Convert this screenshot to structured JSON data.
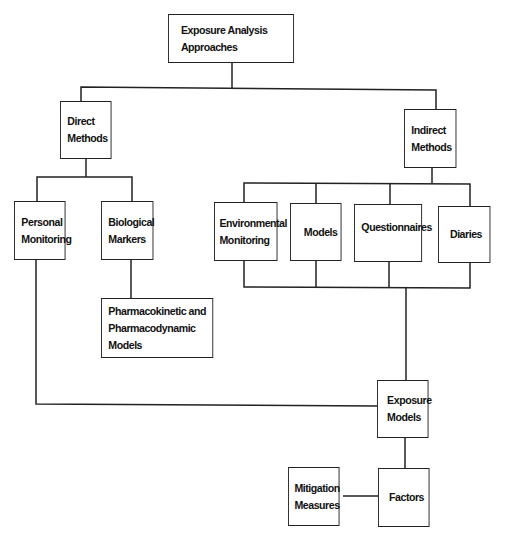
{
  "diagram": {
    "title": "Exposure Analysis Approaches",
    "nodes": {
      "root": {
        "label": "Exposure Analysis\nApproaches"
      },
      "direct": {
        "label": "Direct\nMethods"
      },
      "indirect": {
        "label": "Indirect\nMethods"
      },
      "personal": {
        "label": "Personal\nMonitoring"
      },
      "biological": {
        "label": "Biological\nMarkers"
      },
      "pharmaco": {
        "label": "Pharmacokinetic and\nPharmacodynamic Models"
      },
      "environmental": {
        "label": "Environmental\nMonitoring"
      },
      "models": {
        "label": "Models"
      },
      "questionnaires": {
        "label": "Questionnaires"
      },
      "diaries": {
        "label": "Diaries"
      },
      "exposure_models": {
        "label": "Exposure\nModels"
      },
      "factors": {
        "label": "Factors"
      },
      "mitigation": {
        "label": "Mitigation\nMeasures"
      }
    },
    "edges": [
      [
        "root",
        "direct"
      ],
      [
        "root",
        "indirect"
      ],
      [
        "direct",
        "personal"
      ],
      [
        "direct",
        "biological"
      ],
      [
        "biological",
        "pharmaco"
      ],
      [
        "indirect",
        "environmental"
      ],
      [
        "indirect",
        "models"
      ],
      [
        "indirect",
        "questionnaires"
      ],
      [
        "indirect",
        "diaries"
      ],
      [
        "environmental",
        "exposure_models"
      ],
      [
        "models",
        "exposure_models"
      ],
      [
        "questionnaires",
        "exposure_models"
      ],
      [
        "diaries",
        "exposure_models"
      ],
      [
        "personal",
        "exposure_models"
      ],
      [
        "exposure_models",
        "factors"
      ],
      [
        "mitigation",
        "factors"
      ]
    ]
  }
}
